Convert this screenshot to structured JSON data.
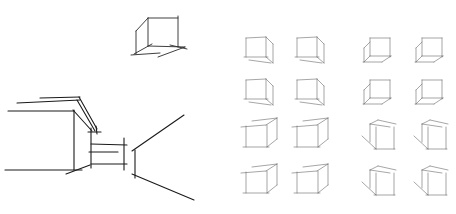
{
  "image": {
    "description": "Pencil sketch study sheet: a single cube in two-point view, a corridor/step perspective sketch, and a 4x4 grid of cube drawings",
    "background": "#ffffff",
    "ink_color": "#2a2a2a"
  },
  "sketches": {
    "single_cube": {
      "label": "cube-study",
      "view": "below-eye-level, left-facing depth"
    },
    "perspective_scene": {
      "label": "corridor-with-step",
      "elements": [
        "overhang-slab",
        "wall-block",
        "step",
        "corridor-walls"
      ]
    },
    "cube_grid": {
      "rows": 4,
      "cols": 4,
      "cells": [
        {
          "row": 0,
          "col": 0,
          "variant": "cube-right-depth"
        },
        {
          "row": 0,
          "col": 1,
          "variant": "cube-right-depth"
        },
        {
          "row": 0,
          "col": 2,
          "variant": "cube-left-depth"
        },
        {
          "row": 0,
          "col": 3,
          "variant": "cube-left-depth"
        },
        {
          "row": 1,
          "col": 0,
          "variant": "cube-right-depth"
        },
        {
          "row": 1,
          "col": 1,
          "variant": "cube-right-depth"
        },
        {
          "row": 1,
          "col": 2,
          "variant": "cube-left-depth"
        },
        {
          "row": 1,
          "col": 3,
          "variant": "cube-left-depth"
        },
        {
          "row": 2,
          "col": 0,
          "variant": "box-top-right"
        },
        {
          "row": 2,
          "col": 1,
          "variant": "box-top-right"
        },
        {
          "row": 2,
          "col": 2,
          "variant": "box-top-left"
        },
        {
          "row": 2,
          "col": 3,
          "variant": "box-top-left"
        },
        {
          "row": 3,
          "col": 0,
          "variant": "box-top-right"
        },
        {
          "row": 3,
          "col": 1,
          "variant": "box-top-right"
        },
        {
          "row": 3,
          "col": 2,
          "variant": "box-top-left"
        },
        {
          "row": 3,
          "col": 3,
          "variant": "box-top-left"
        }
      ]
    }
  }
}
